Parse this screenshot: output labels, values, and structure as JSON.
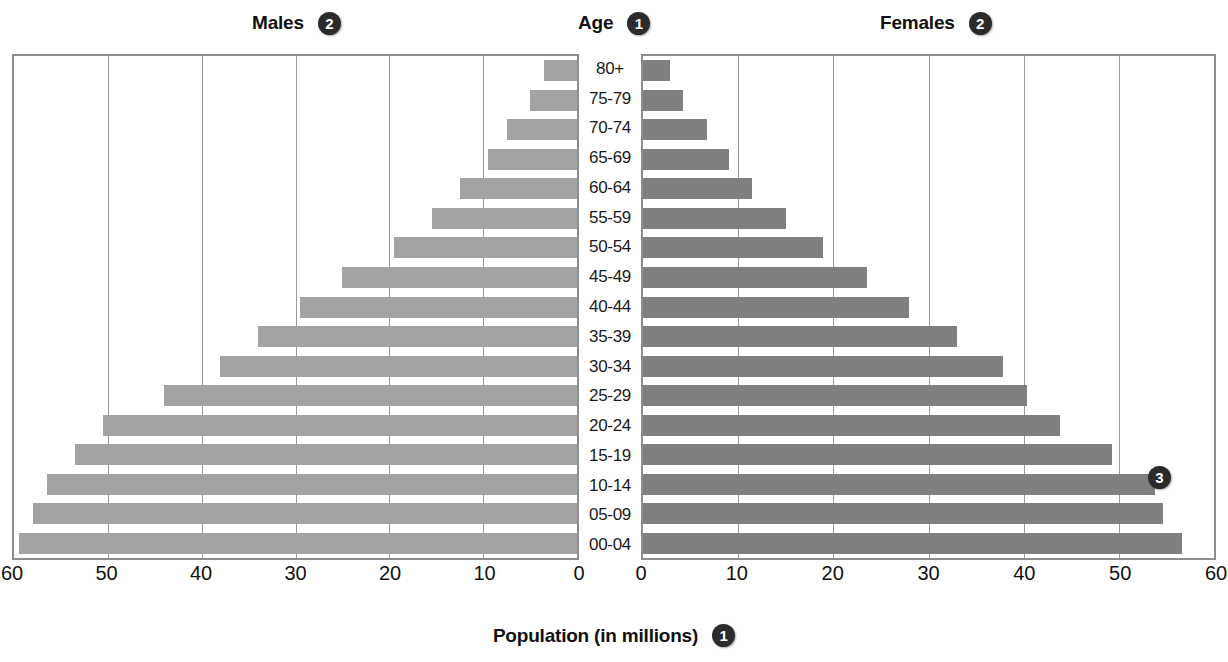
{
  "header": {
    "males_label": "Males",
    "males_badge": "2",
    "age_label": "Age",
    "age_badge": "1",
    "females_label": "Females",
    "females_badge": "2"
  },
  "callout": {
    "badge_3": "3"
  },
  "axis_title": {
    "text": "Population (in millions)",
    "badge": "1"
  },
  "colors": {
    "male_bar": "#a3a3a3",
    "female_bar": "#7f7f7f",
    "gridline": "#9a9a9a",
    "frame": "#8d8d8d",
    "badge_bg": "#2b2b2b",
    "badge_text": "#ffffff"
  },
  "chart_data": {
    "type": "bar",
    "subtype": "population-pyramid",
    "xlabel": "Population (in millions)",
    "ylabel": "Age",
    "xlim": [
      0,
      60
    ],
    "grid": true,
    "legend_position": "top",
    "left_ticks": [
      "60",
      "50",
      "40",
      "30",
      "20",
      "10",
      "0"
    ],
    "right_ticks": [
      "0",
      "10",
      "20",
      "30",
      "40",
      "50",
      "60"
    ],
    "tick_values": [
      0,
      10,
      20,
      30,
      40,
      50,
      60
    ],
    "categories": [
      "80+",
      "75-79",
      "70-74",
      "65-69",
      "60-64",
      "55-59",
      "50-54",
      "45-49",
      "40-44",
      "35-39",
      "30-34",
      "25-29",
      "20-24",
      "15-19",
      "10-14",
      "05-09",
      "00-04"
    ],
    "series": [
      {
        "name": "Males",
        "side": "left",
        "values": [
          3.5,
          5.0,
          7.5,
          9.5,
          12.5,
          15.5,
          19.5,
          25.0,
          29.5,
          34.0,
          38.0,
          44.0,
          50.5,
          53.5,
          56.5,
          58.0,
          59.5
        ]
      },
      {
        "name": "Females",
        "side": "right",
        "values": [
          2.8,
          4.2,
          6.7,
          9.0,
          11.5,
          15.0,
          18.9,
          23.5,
          28.0,
          33.0,
          37.8,
          40.3,
          43.8,
          49.3,
          53.8,
          54.6,
          56.6
        ]
      }
    ],
    "annotations": [
      {
        "label": "1",
        "target": "Age axis"
      },
      {
        "label": "2",
        "target": "Males / Females group labels"
      },
      {
        "label": "3",
        "target": "Bars (15-19 Females)"
      },
      {
        "label": "1",
        "target": "Population (in millions) axis title"
      }
    ]
  }
}
